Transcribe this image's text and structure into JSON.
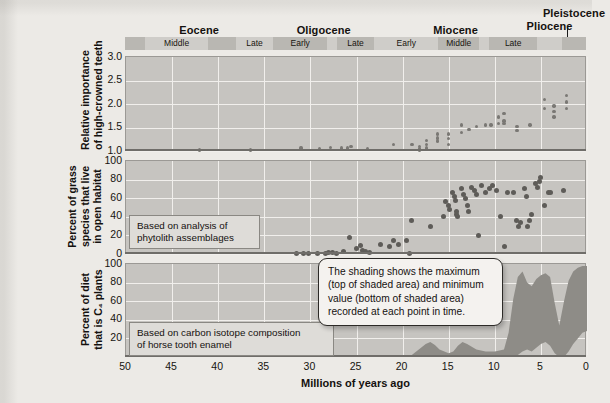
{
  "figure": {
    "xaxis_title": "Millions of years ago",
    "x_ticks": [
      "50",
      "45",
      "40",
      "35",
      "30",
      "25",
      "20",
      "15",
      "10",
      "5",
      "0"
    ],
    "x_range": [
      50,
      0
    ]
  },
  "timescale": {
    "epochs": [
      {
        "name": "Eocene",
        "start": 50.0,
        "end": 33.9
      },
      {
        "name": "Oligocene",
        "start": 33.9,
        "end": 23.0
      },
      {
        "name": "Miocene",
        "start": 23.0,
        "end": 5.3
      },
      {
        "name": "Pliocene",
        "start": 5.3,
        "end": 2.6
      },
      {
        "name": "Pleistocene",
        "start": 2.6,
        "end": 0.0
      }
    ],
    "stages": [
      {
        "name": "",
        "start": 50.0,
        "end": 47.8,
        "shaded": true
      },
      {
        "name": "Middle",
        "start": 47.8,
        "end": 41.0,
        "shaded": false
      },
      {
        "name": "",
        "start": 41.0,
        "end": 38.0,
        "shaded": true
      },
      {
        "name": "Late",
        "start": 38.0,
        "end": 33.9,
        "shaded": false
      },
      {
        "name": "Early",
        "start": 33.9,
        "end": 28.1,
        "shaded": true
      },
      {
        "name": "",
        "start": 28.1,
        "end": 27.0,
        "shaded": false
      },
      {
        "name": "Late",
        "start": 27.0,
        "end": 23.0,
        "shaded": true
      },
      {
        "name": "Early",
        "start": 23.0,
        "end": 16.0,
        "shaded": false
      },
      {
        "name": "Middle",
        "start": 16.0,
        "end": 11.6,
        "shaded": true
      },
      {
        "name": "",
        "start": 11.6,
        "end": 10.5,
        "shaded": false
      },
      {
        "name": "Late",
        "start": 10.5,
        "end": 5.3,
        "shaded": true
      },
      {
        "name": "",
        "start": 5.3,
        "end": 2.6,
        "shaded": false
      },
      {
        "name": "",
        "start": 2.6,
        "end": 0.0,
        "shaded": true
      }
    ]
  },
  "panels": [
    {
      "id": "hypsodonty",
      "ylabel": "Relative importance\nof high-crowned teeth",
      "y_ticks": [
        "3.0",
        "2.5",
        "2.0",
        "1.5",
        "1.0"
      ],
      "y_range": [
        1.0,
        3.0
      ],
      "callout": null
    },
    {
      "id": "grass-open-habitat",
      "ylabel": "Percent of grass\nspecies that live\nin open habitat",
      "y_ticks": [
        "100",
        "80",
        "60",
        "40",
        "20",
        "0"
      ],
      "y_range": [
        0,
        100
      ],
      "callout": "Based on analysis of\nphytolith assemblages"
    },
    {
      "id": "c4-diet",
      "ylabel": "Percent of diet\nthat is C₄ plants",
      "y_ticks": [
        "100",
        "80",
        "60",
        "40",
        "20"
      ],
      "y_range": [
        0,
        100
      ],
      "callout": "Based on carbon isotope composition\nof horse tooth enamel"
    }
  ],
  "shading_note": "The shading shows the maximum\n(top of shaded area) and minimum\nvalue (bottom of shaded area)\nrecorded at each point in time.",
  "colors": {
    "page_background": "#eceae6",
    "panel_fill": "#c6c4c0",
    "gridline": "#f1efec",
    "marker": "#6e6c68",
    "stage_bar": "#cfcdc9",
    "stage_bar_shaded": "#b9b7b2",
    "text": "#14110f"
  },
  "chart_data": [
    {
      "type": "scatter",
      "id": "hypsodonty",
      "title": "Relative importance of high-crowned teeth",
      "xlabel": "Millions of years ago",
      "ylabel": "Relative importance of high-crowned teeth",
      "xlim": [
        50,
        0
      ],
      "ylim": [
        1.0,
        3.0
      ],
      "grid": true,
      "points": [
        [
          42.0,
          1.02
        ],
        [
          36.5,
          1.02
        ],
        [
          31.0,
          1.06
        ],
        [
          29.0,
          1.05
        ],
        [
          27.8,
          1.08
        ],
        [
          26.6,
          1.06
        ],
        [
          26.0,
          1.06
        ],
        [
          25.6,
          1.09
        ],
        [
          23.8,
          1.04
        ],
        [
          21.0,
          1.14
        ],
        [
          19.0,
          1.14
        ],
        [
          18.2,
          1.05
        ],
        [
          18.2,
          1.1
        ],
        [
          18.2,
          1.01
        ],
        [
          17.4,
          1.22
        ],
        [
          17.4,
          1.14
        ],
        [
          17.4,
          1.06
        ],
        [
          16.2,
          1.28
        ],
        [
          16.2,
          1.21
        ],
        [
          16.2,
          1.36
        ],
        [
          15.0,
          1.36
        ],
        [
          15.0,
          1.26
        ],
        [
          15.0,
          1.14
        ],
        [
          13.6,
          1.55
        ],
        [
          13.6,
          1.4
        ],
        [
          12.8,
          1.46
        ],
        [
          12.0,
          1.52
        ],
        [
          11.0,
          1.55
        ],
        [
          10.4,
          1.55
        ],
        [
          9.6,
          1.72
        ],
        [
          9.6,
          1.58
        ],
        [
          9.0,
          1.8
        ],
        [
          9.0,
          1.64
        ],
        [
          9.0,
          1.58
        ],
        [
          7.6,
          1.52
        ],
        [
          7.6,
          1.44
        ],
        [
          6.2,
          1.55
        ],
        [
          4.6,
          2.1
        ],
        [
          4.6,
          1.9
        ],
        [
          3.6,
          1.96
        ],
        [
          3.6,
          1.84
        ],
        [
          3.6,
          1.72
        ],
        [
          2.2,
          2.18
        ],
        [
          2.2,
          2.04
        ],
        [
          2.2,
          1.9
        ]
      ]
    },
    {
      "type": "scatter",
      "id": "grass-open-habitat",
      "title": "Percent of grass species that live in open habitat",
      "xlabel": "Millions of years ago",
      "ylabel": "Percent of grass species that live in open habitat",
      "xlim": [
        50,
        0
      ],
      "ylim": [
        0,
        100
      ],
      "grid": true,
      "note": "Based on analysis of phytolith assemblages",
      "points": [
        [
          31.5,
          1
        ],
        [
          30.8,
          1
        ],
        [
          30.2,
          1
        ],
        [
          29.2,
          1
        ],
        [
          28.4,
          1
        ],
        [
          28.0,
          2
        ],
        [
          27.6,
          2
        ],
        [
          27.2,
          1
        ],
        [
          26.4,
          3
        ],
        [
          25.8,
          18
        ],
        [
          25.0,
          6
        ],
        [
          24.6,
          9
        ],
        [
          24.4,
          4
        ],
        [
          24.0,
          3
        ],
        [
          23.6,
          2
        ],
        [
          22.4,
          10
        ],
        [
          21.4,
          8
        ],
        [
          21.0,
          14
        ],
        [
          20.4,
          10
        ],
        [
          19.6,
          14
        ],
        [
          19.2,
          1
        ],
        [
          19.0,
          36
        ],
        [
          17.0,
          30
        ],
        [
          15.6,
          40
        ],
        [
          15.4,
          56
        ],
        [
          15.0,
          52
        ],
        [
          14.9,
          48
        ],
        [
          14.6,
          66
        ],
        [
          14.4,
          62
        ],
        [
          14.3,
          58
        ],
        [
          14.2,
          46
        ],
        [
          14.1,
          43
        ],
        [
          14.0,
          40
        ],
        [
          13.6,
          70
        ],
        [
          13.4,
          64
        ],
        [
          13.2,
          60
        ],
        [
          13.0,
          52
        ],
        [
          12.8,
          46
        ],
        [
          12.5,
          72
        ],
        [
          12.2,
          68
        ],
        [
          12.0,
          64
        ],
        [
          11.8,
          20
        ],
        [
          11.4,
          74
        ],
        [
          11.0,
          66
        ],
        [
          10.6,
          70
        ],
        [
          10.2,
          74
        ],
        [
          9.8,
          68
        ],
        [
          9.4,
          40
        ],
        [
          9.0,
          8
        ],
        [
          8.6,
          66
        ],
        [
          8.0,
          66
        ],
        [
          7.6,
          36
        ],
        [
          7.4,
          30
        ],
        [
          7.2,
          34
        ],
        [
          6.8,
          70
        ],
        [
          6.6,
          62
        ],
        [
          6.4,
          30
        ],
        [
          6.2,
          36
        ],
        [
          6.0,
          42
        ],
        [
          5.6,
          76
        ],
        [
          5.4,
          72
        ],
        [
          5.2,
          78
        ],
        [
          5.0,
          82
        ],
        [
          4.6,
          52
        ],
        [
          4.2,
          66
        ],
        [
          4.0,
          66
        ],
        [
          2.6,
          68
        ]
      ]
    },
    {
      "type": "area",
      "id": "c4-diet",
      "title": "Percent of diet that is C4 plants",
      "xlabel": "Millions of years ago",
      "ylabel": "Percent of diet that is C4 plants",
      "xlim": [
        50,
        0
      ],
      "ylim": [
        0,
        100
      ],
      "grid": true,
      "note": "Based on carbon isotope composition of horse tooth enamel",
      "description": "Shaded band spanning minimum to maximum recorded value at each point in time; values stay near 0 before ~20 Ma, show small humps ~19-13 Ma, then rise steeply after ~8 Ma to a maximum near 90-100%.",
      "x": [
        20.0,
        19.0,
        18.0,
        17.5,
        17.0,
        16.5,
        16.0,
        15.0,
        14.5,
        14.0,
        13.5,
        13.0,
        12.0,
        11.0,
        10.0,
        9.0,
        8.5,
        8.0,
        7.5,
        7.0,
        6.5,
        6.0,
        5.5,
        5.0,
        4.5,
        4.0,
        3.5,
        3.0,
        2.5,
        2.0,
        1.5,
        1.0,
        0.5,
        0.0
      ],
      "max": [
        0,
        2,
        10,
        14,
        16,
        13,
        8,
        4,
        6,
        12,
        16,
        14,
        8,
        6,
        6,
        8,
        26,
        62,
        86,
        92,
        80,
        76,
        84,
        88,
        90,
        86,
        58,
        34,
        60,
        82,
        92,
        96,
        98,
        98
      ],
      "min": [
        0,
        0,
        0,
        0,
        0,
        0,
        0,
        0,
        0,
        0,
        0,
        0,
        0,
        0,
        0,
        0,
        0,
        0,
        2,
        6,
        8,
        6,
        10,
        14,
        16,
        12,
        4,
        0,
        0,
        6,
        14,
        20,
        26,
        28
      ]
    }
  ]
}
